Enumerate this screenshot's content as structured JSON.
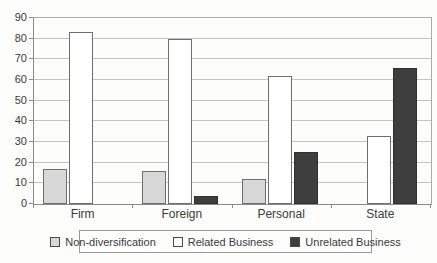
{
  "chart_data": {
    "type": "bar",
    "categories": [
      "Firm",
      "Foreign",
      "Personal",
      "State"
    ],
    "series": [
      {
        "name": "Non-diversification",
        "values": [
          17,
          16,
          12,
          0
        ]
      },
      {
        "name": "Related Business",
        "values": [
          83,
          80,
          62,
          33
        ]
      },
      {
        "name": "Unrelated Business",
        "values": [
          0,
          4,
          25,
          66
        ]
      }
    ],
    "title": "",
    "xlabel": "",
    "ylabel": "",
    "ylim": [
      0,
      90
    ],
    "ytick_step": 10,
    "ytick_labels": [
      "90",
      "80",
      "70",
      "60",
      "50",
      "40",
      "30",
      "20",
      "10",
      "0"
    ],
    "grid": true,
    "legend_position": "bottom",
    "colors": {
      "Non-diversification": {
        "fill": "#d8d8d8",
        "border": "#6e6e6e"
      },
      "Related Business": {
        "fill": "#fefefe",
        "border": "#6e6e6e"
      },
      "Unrelated Business": {
        "fill": "#3e3e3e",
        "border": "#303030"
      }
    },
    "gridline_color": "#c4c4c4",
    "axis_color": "#8a8a8a",
    "background_color": "#fdfdfc"
  }
}
